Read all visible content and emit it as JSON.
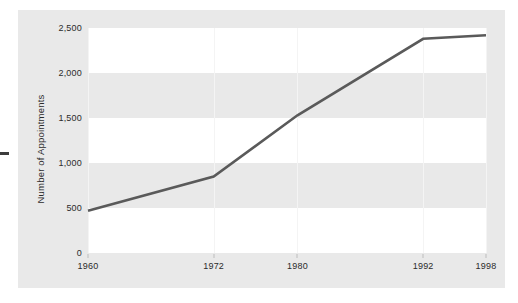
{
  "chart_data": {
    "type": "line",
    "title": "",
    "subtitle": "",
    "xlabel": "",
    "ylabel": "Number of Appointments",
    "x": [
      1960,
      1972,
      1980,
      1992,
      1998
    ],
    "xtick_labels": [
      "1960",
      "1972",
      "1980",
      "1992",
      "1998"
    ],
    "series": [
      {
        "name": "Number of Appointments",
        "values": [
          470,
          850,
          1530,
          2380,
          2420
        ],
        "color": "#5a5a5a"
      }
    ],
    "yticks": [
      0,
      500,
      1000,
      1500,
      2000,
      2500
    ],
    "ytick_labels": [
      "0",
      "500",
      "1,000",
      "1,500",
      "2,000",
      "2,500"
    ],
    "ylim": [
      0,
      2500
    ],
    "xlim": [
      1960,
      1998
    ],
    "grid": "horizontal-bands",
    "legend": "none",
    "annotations": [],
    "colors": {
      "panel_background": "#e9e9e9",
      "band_background": "#ffffff",
      "line": "#5a5a5a",
      "text": "#2b2b2b",
      "gridline": "#f4f4f4"
    },
    "band_ranges": [
      [
        0,
        500
      ],
      [
        1000,
        1500
      ],
      [
        2000,
        2500
      ]
    ]
  }
}
